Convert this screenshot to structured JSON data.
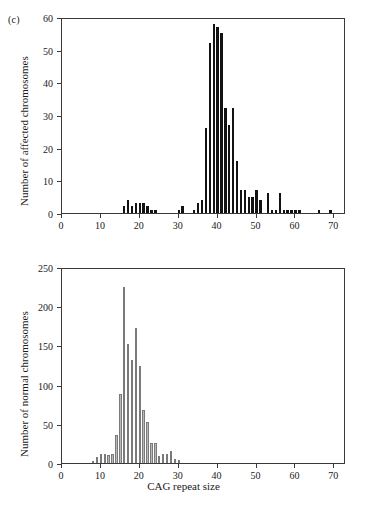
{
  "figure": {
    "panel_label": "(c)",
    "xlabel": "CAG repeat size"
  },
  "chart_data": [
    {
      "type": "bar",
      "id": "affected",
      "title": "",
      "xlabel": "",
      "ylabel": "Number of affected chromosomes",
      "xlim": [
        0,
        73
      ],
      "ylim": [
        0,
        60
      ],
      "xticks": [
        0,
        10,
        20,
        30,
        40,
        50,
        60,
        70
      ],
      "yticks": [
        0,
        10,
        20,
        30,
        40,
        50,
        60
      ],
      "grid": false,
      "legend": "none",
      "bar_color": "#121212",
      "categories": [
        16,
        17,
        18,
        19,
        20,
        21,
        22,
        23,
        24,
        30,
        31,
        34,
        35,
        36,
        37,
        38,
        39,
        40,
        41,
        42,
        43,
        44,
        45,
        46,
        47,
        48,
        49,
        50,
        51,
        53,
        54,
        55,
        56,
        57,
        58,
        59,
        60,
        61,
        66,
        69
      ],
      "values": [
        2,
        4,
        2,
        3,
        3,
        3,
        2,
        1,
        1,
        1,
        2,
        1,
        3,
        4,
        26,
        52,
        58,
        57,
        55,
        32,
        27,
        32,
        16,
        7,
        7,
        5,
        5,
        7,
        4,
        6,
        1,
        1,
        6,
        1,
        1,
        1,
        1,
        1,
        1,
        1
      ]
    },
    {
      "type": "bar",
      "id": "normal",
      "title": "",
      "xlabel": "CAG repeat size",
      "ylabel": "Number of normal chromosomes",
      "xlim": [
        0,
        73
      ],
      "ylim": [
        0,
        250
      ],
      "xticks": [
        0,
        10,
        20,
        30,
        40,
        50,
        60,
        70
      ],
      "yticks": [
        0,
        50,
        100,
        150,
        200,
        250
      ],
      "grid": false,
      "legend": "none",
      "bar_color": "#b9b9b9",
      "bar_edge_color": "#7a7a7a",
      "categories": [
        8,
        9,
        10,
        11,
        12,
        13,
        14,
        15,
        16,
        17,
        18,
        19,
        20,
        21,
        22,
        23,
        24,
        25,
        26,
        27,
        28,
        29,
        30
      ],
      "values": [
        3,
        8,
        11,
        12,
        10,
        11,
        36,
        88,
        224,
        152,
        131,
        172,
        124,
        67,
        52,
        26,
        25,
        9,
        11,
        11,
        15,
        5,
        4
      ]
    }
  ]
}
